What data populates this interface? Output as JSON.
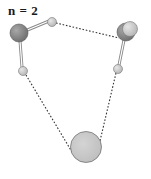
{
  "title": "n = 2",
  "colors": {
    "oxygen": "#8a8a8a",
    "oxygen_stroke": "#5a5a5a",
    "hydrogen": "#cfcfcf",
    "hydrogen_stroke": "#7a7a7a",
    "ion": "#c8c8c8",
    "ion_stroke": "#6f6f6f",
    "bond": "#9a9a9a",
    "hbond": "#333333"
  },
  "atoms": [
    {
      "id": "O1",
      "kind": "oxygen",
      "cx": 19,
      "cy": 33,
      "r": 9
    },
    {
      "id": "H1a",
      "kind": "hydrogen",
      "cx": 52,
      "cy": 22,
      "r": 4.5
    },
    {
      "id": "H1b",
      "kind": "hydrogen",
      "cx": 23,
      "cy": 71,
      "r": 4.5
    },
    {
      "id": "O2",
      "kind": "oxygen",
      "cx": 126,
      "cy": 32,
      "r": 9
    },
    {
      "id": "X2",
      "kind": "hydrogen-overlap",
      "cx": 130,
      "cy": 29,
      "r": 8
    },
    {
      "id": "H2b",
      "kind": "hydrogen",
      "cx": 118,
      "cy": 69,
      "r": 4.5
    },
    {
      "id": "M",
      "kind": "ion",
      "cx": 86,
      "cy": 147,
      "r": 15.5
    }
  ],
  "bonds": [
    {
      "from": "O1",
      "to": "H1a",
      "type": "covalent"
    },
    {
      "from": "O1",
      "to": "H1b",
      "type": "covalent"
    },
    {
      "from": "O2",
      "to": "H2b",
      "type": "covalent"
    }
  ],
  "hbonds": [
    {
      "from": "H1a",
      "to": "O2",
      "type": "dashed"
    },
    {
      "from": "H1b",
      "to": "M",
      "type": "dashed"
    },
    {
      "from": "H2b",
      "to": "M",
      "type": "dashed"
    }
  ]
}
